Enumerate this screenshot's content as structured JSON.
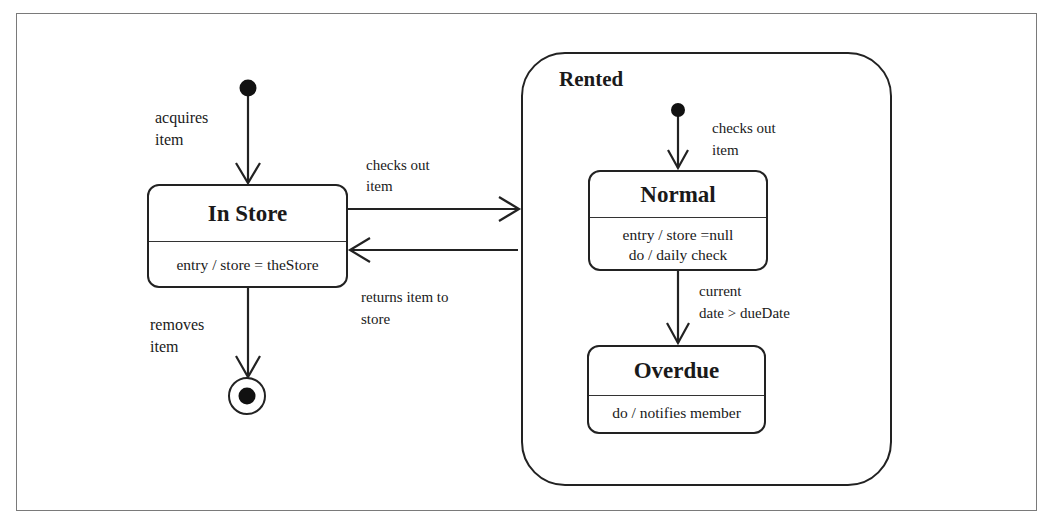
{
  "diagram": {
    "type": "uml-state-machine",
    "composite_state": {
      "name": "Rented"
    },
    "states": [
      {
        "id": "in-store",
        "name": "In Store",
        "activities": [
          "entry / store = theStore"
        ]
      },
      {
        "id": "normal",
        "name": "Normal",
        "activities": [
          "entry / store =null",
          "do / daily check"
        ]
      },
      {
        "id": "overdue",
        "name": "Overdue",
        "activities": [
          "do / notifies member"
        ]
      }
    ],
    "transitions": [
      {
        "from": "initial",
        "to": "In Store",
        "label": [
          "acquires",
          "item"
        ]
      },
      {
        "from": "In Store",
        "to": "Rented",
        "label": [
          "checks out",
          "item"
        ]
      },
      {
        "from": "Rented",
        "to": "In Store",
        "label": [
          "returns item to",
          "store"
        ]
      },
      {
        "from": "In Store",
        "to": "final",
        "label": [
          "removes",
          "item"
        ]
      },
      {
        "from": "initial (Rented)",
        "to": "Normal",
        "label": [
          "checks out",
          "item"
        ]
      },
      {
        "from": "Normal",
        "to": "Overdue",
        "label": [
          "current",
          "date > dueDate"
        ]
      }
    ]
  }
}
